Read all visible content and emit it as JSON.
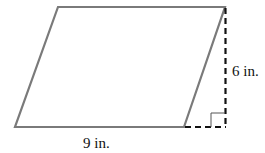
{
  "figure": {
    "shape": "parallelogram",
    "base_label": "9 in.",
    "height_label": "6 in.",
    "colors": {
      "outline": "#7a7a7a",
      "dashed": "#111111",
      "text": "#111111"
    }
  }
}
